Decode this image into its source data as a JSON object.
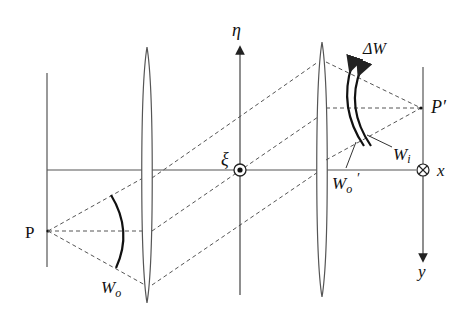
{
  "figure": {
    "type": "optical-imaging-diagram",
    "labels": {
      "object_point": "P",
      "image_point": "P′",
      "eta_axis": "η",
      "xi_axis": "ξ",
      "x_axis": "x",
      "y_axis": "y",
      "object_wavefront": "W",
      "object_wavefront_sub": "o",
      "image_wavefront": "W",
      "image_wavefront_sub": "i",
      "relayed_wavefront": "W",
      "relayed_wavefront_sub": "o",
      "relayed_wavefront_prime": "′",
      "wavefront_error": "ΔW"
    },
    "elements": [
      {
        "name": "object-plane",
        "kind": "vertical-line"
      },
      {
        "name": "lens-1",
        "kind": "thin-lens"
      },
      {
        "name": "pupil-plane-eta-axis",
        "kind": "arrow-axis"
      },
      {
        "name": "lens-2",
        "kind": "thin-lens"
      },
      {
        "name": "image-plane",
        "kind": "vertical-line"
      },
      {
        "name": "optical-axis",
        "kind": "horizontal-line"
      }
    ],
    "markers": {
      "xi_origin": "dot-in-circle (out of page)",
      "x_origin": "cross-in-circle (into page)"
    },
    "colors": {
      "line": "#555555",
      "wavefront": "#111111",
      "background": "#ffffff"
    }
  }
}
